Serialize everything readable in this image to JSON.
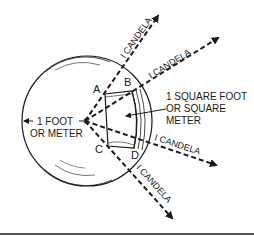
{
  "diagram": {
    "points": {
      "a": "A",
      "b": "B",
      "c": "C",
      "d": "D"
    },
    "radius_label": {
      "line1": "1 FOOT",
      "line2": "OR METER"
    },
    "area_label": {
      "line1": "1 SQUARE FOOT",
      "line2": "OR SQUARE",
      "line3": "METER"
    },
    "rays": [
      {
        "label": "I CANDELA"
      },
      {
        "label": "I CANDELA"
      },
      {
        "label": "I CANDELA"
      },
      {
        "label": "I CANDELA"
      }
    ],
    "colors": {
      "ink": "#1a1a1a",
      "rule": "#555555",
      "background": "#ffffff"
    }
  }
}
